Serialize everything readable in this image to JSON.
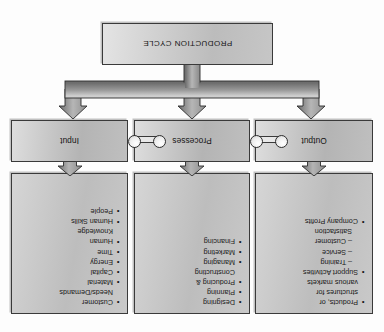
{
  "diagram": {
    "title": "Production Cycle",
    "orientation": "rotated-180",
    "colors": {
      "panel_fill_light": "#d6d6d6",
      "panel_fill_dark": "#bdbdbd",
      "panel_border": "#3a3a3a",
      "arrow_fill_light": "#d2d2d2",
      "arrow_fill_dark": "#6f6f6f",
      "background": "#fdfdfd",
      "text": "#1a1a1a"
    }
  },
  "content_panels": {
    "output": {
      "name": "Output",
      "items": [
        {
          "text": "Products, or",
          "style": "bullet"
        },
        {
          "text": "structures for",
          "style": "continuation"
        },
        {
          "text": "various markets",
          "style": "continuation"
        },
        {
          "text": "Support Activities",
          "style": "bullet"
        },
        {
          "text": "– Training",
          "style": "sub"
        },
        {
          "text": "– Service",
          "style": "sub"
        },
        {
          "text": "– Customer",
          "style": "sub"
        },
        {
          "text": "Satisfaction",
          "style": "sub-continuation"
        },
        {
          "text": "Company Profits",
          "style": "bullet"
        }
      ]
    },
    "processes": {
      "name": "Processes",
      "items": [
        {
          "text": "Designing",
          "style": "bullet"
        },
        {
          "text": "Planning",
          "style": "bullet"
        },
        {
          "text": "Producing &",
          "style": "bullet"
        },
        {
          "text": "Constructing",
          "style": "continuation"
        },
        {
          "text": "Managing",
          "style": "bullet"
        },
        {
          "text": "Marketing",
          "style": "bullet"
        },
        {
          "text": "Financing",
          "style": "bullet"
        }
      ]
    },
    "input": {
      "name": "Input",
      "items": [
        {
          "text": "Customer",
          "style": "bullet"
        },
        {
          "text": "Needs/Demands",
          "style": "continuation"
        },
        {
          "text": "Material",
          "style": "bullet"
        },
        {
          "text": "Capital",
          "style": "bullet"
        },
        {
          "text": "Energy",
          "style": "bullet"
        },
        {
          "text": "Time",
          "style": "bullet"
        },
        {
          "text": "Human",
          "style": "bullet"
        },
        {
          "text": "Knowledge",
          "style": "continuation"
        },
        {
          "text": "Human Skills",
          "style": "bullet"
        },
        {
          "text": "People",
          "style": "bullet"
        }
      ]
    }
  },
  "stages": {
    "output_label": "Output",
    "processes_label": "Processes",
    "input_label": "Input"
  },
  "footer": {
    "cycle_label": "PRODUCTION CYCLE"
  }
}
